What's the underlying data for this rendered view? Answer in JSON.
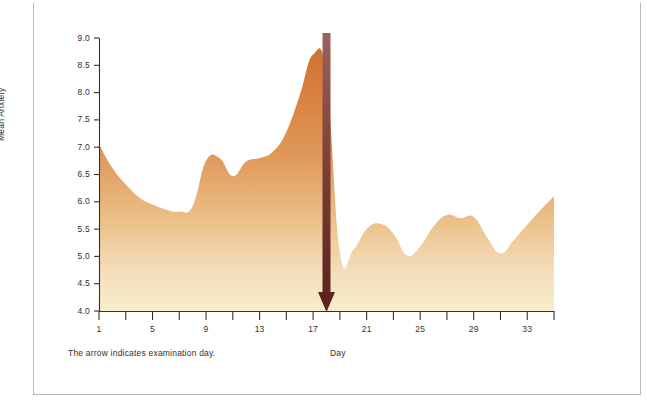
{
  "figure": {
    "border_color": "#b9b9b9",
    "background": "#ffffff"
  },
  "caption": "The arrow indicates examination day.",
  "annotation": {
    "arrow_name": "examination-day-arrow",
    "arrow_color_top": "#8c5750",
    "arrow_color_bottom": "#5e2420",
    "arrow_day": 18
  },
  "chart_data": {
    "type": "area",
    "title": "",
    "subtitle": "",
    "xlabel": "Day",
    "ylabel": "Mean Anxiety",
    "xlim": [
      1,
      35
    ],
    "ylim": [
      4.0,
      9.0
    ],
    "grid": false,
    "legend": null,
    "fill_top_color": "#d9783f",
    "fill_bottom_color": "#f6ecbe",
    "axis_color": "#35302e",
    "x_ticks_major": [
      1,
      5,
      9,
      13,
      17,
      21,
      25,
      29,
      33
    ],
    "x_tick_labels": [
      "1",
      "5",
      "9",
      "13",
      "17",
      "21",
      "25",
      "29",
      "33"
    ],
    "x_ticks_minor": [
      3,
      7,
      11,
      15,
      19,
      23,
      27,
      31,
      35
    ],
    "y_ticks": [
      4.0,
      4.5,
      5.0,
      5.5,
      6.0,
      6.5,
      7.0,
      7.5,
      8.0,
      8.5,
      9.0
    ],
    "y_tick_labels": [
      "4.0",
      "4.5",
      "5.0",
      "5.5",
      "6.0",
      "6.5",
      "7.0",
      "7.5",
      "8.0",
      "8.5",
      "9.0"
    ],
    "x": [
      1,
      2,
      3,
      4,
      5,
      6,
      7,
      8,
      9,
      10,
      11,
      12,
      13,
      14,
      15,
      16,
      17,
      18,
      19,
      20,
      21,
      22,
      23,
      24,
      25,
      26,
      27,
      28,
      29,
      30,
      31,
      32,
      33,
      34,
      35
    ],
    "values": [
      7.05,
      6.62,
      6.32,
      6.08,
      5.95,
      5.86,
      5.82,
      5.92,
      6.75,
      6.8,
      6.47,
      6.74,
      6.8,
      6.92,
      7.28,
      7.95,
      8.7,
      8.3,
      5.08,
      5.12,
      5.5,
      5.6,
      5.42,
      5.02,
      5.18,
      5.55,
      5.76,
      5.7,
      5.72,
      5.35,
      5.05,
      5.3,
      5.58,
      5.85,
      6.1
    ],
    "annotations": [
      {
        "label": "examination day",
        "x": 18,
        "type": "down-arrow"
      }
    ]
  }
}
